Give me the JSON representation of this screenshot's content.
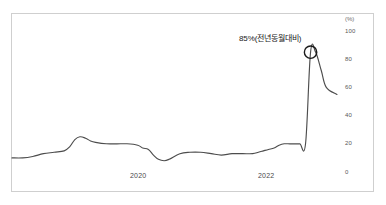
{
  "chart_data": {
    "type": "line",
    "title": "",
    "subtitle": "",
    "xlabel": "",
    "ylabel": "(%)",
    "ylim": [
      0,
      100
    ],
    "yticks": [
      0,
      20,
      40,
      60,
      80,
      100
    ],
    "ytick_labels": [
      "0",
      "20",
      "40",
      "60",
      "80",
      "100"
    ],
    "y_axis_position": "right",
    "y_unit_label": "(%)",
    "grid": false,
    "legend": "none",
    "xticks": [
      2020,
      2022
    ],
    "xtick_labels": [
      "2020",
      "2022"
    ],
    "xlim": [
      2018.25,
      2023.5
    ],
    "line_color": "#4d4d4d",
    "annotations": [
      {
        "name": "peak-callout",
        "text": "85%(전년동월대비)",
        "value": 85,
        "marker": "circle",
        "marker_x": 2023.0,
        "marker_y": 85
      }
    ],
    "series": [
      {
        "name": "value",
        "x": [
          2018.25,
          2018.42,
          2018.58,
          2018.75,
          2018.92,
          2019.08,
          2019.17,
          2019.25,
          2019.33,
          2019.42,
          2019.5,
          2019.58,
          2019.75,
          2019.92,
          2020.08,
          2020.25,
          2020.33,
          2020.42,
          2020.5,
          2020.58,
          2020.67,
          2020.75,
          2020.92,
          2021.08,
          2021.25,
          2021.42,
          2021.58,
          2021.75,
          2021.92,
          2022.08,
          2022.17,
          2022.25,
          2022.33,
          2022.42,
          2022.5,
          2022.58,
          2022.67,
          2022.75,
          2022.83,
          2022.92,
          2023.0,
          2023.08,
          2023.17,
          2023.25,
          2023.42
        ],
        "values": [
          10,
          10,
          11,
          13,
          14,
          15,
          18,
          23,
          25,
          24,
          22,
          21,
          20,
          20,
          20,
          19,
          17,
          16,
          12,
          9,
          8,
          9,
          13,
          14,
          14,
          13,
          12,
          13,
          13,
          13,
          14,
          15,
          16,
          17,
          19,
          20,
          20,
          20,
          20,
          20,
          85,
          85,
          72,
          60,
          55
        ]
      }
    ]
  },
  "annotation": {
    "callout_text": "85%(전년동월대비)"
  },
  "axes": {
    "unit": "(%)",
    "y_labels": [
      "100",
      "80",
      "60",
      "40",
      "20",
      "0"
    ],
    "x_labels": [
      "2020",
      "2022"
    ]
  }
}
